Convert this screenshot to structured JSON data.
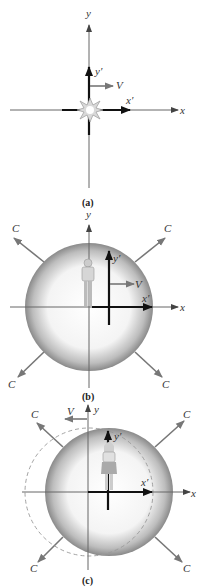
{
  "panels": [
    {
      "id": "a",
      "caption": "(a)",
      "labels": {
        "y": "y",
        "x": "x",
        "y_prime": "y′",
        "x_prime": "x′",
        "velocity": "V"
      },
      "description": "Flash emitted at origin as primed frame coincides with unprimed frame"
    },
    {
      "id": "b",
      "caption": "(b)",
      "labels": {
        "y": "y",
        "x": "x",
        "y_prime": "y′",
        "x_prime": "x′",
        "velocity": "V",
        "light_speed": "C"
      },
      "description": "Light sphere centered on unprimed origin; observer stands at origin; primed frame moves right with V"
    },
    {
      "id": "c",
      "caption": "(c)",
      "labels": {
        "y": "y",
        "x": "x",
        "y_prime": "y′",
        "x_prime": "x′",
        "velocity": "V",
        "light_speed": "C"
      },
      "description": "Light sphere centered on primed origin; unprimed frame moves left with V; dashed circle shows other frame's sphere"
    }
  ],
  "colors": {
    "axis": "#555555",
    "primed_axis": "#111111",
    "arrow_gray": "#777777",
    "sphere_edge": "#888888"
  }
}
